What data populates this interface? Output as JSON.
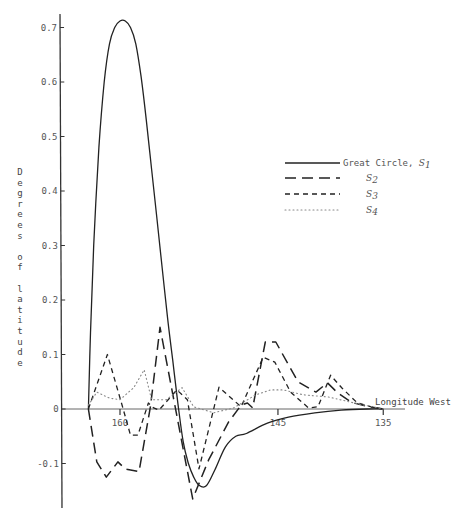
{
  "chart_data": {
    "type": "line",
    "title": "",
    "xlabel": "Longitude West",
    "ylabel": "Degrees of latitude",
    "x_ticks": [
      "160",
      "145",
      "135"
    ],
    "x_tick_values": [
      160,
      145,
      135
    ],
    "y_ticks": [
      "0.7",
      "0.6",
      "0.5",
      "0.4",
      "0.3",
      "0.2",
      "0.1",
      "0",
      "-0.1"
    ],
    "y_tick_values": [
      0.7,
      0.6,
      0.5,
      0.4,
      0.3,
      0.2,
      0.1,
      0,
      -0.1
    ],
    "xlim": [
      163.0,
      133.0
    ],
    "ylim": [
      -0.18,
      0.72
    ],
    "x_reversed": true,
    "grid": false,
    "legend_position": "right-middle",
    "series": [
      {
        "name": "Great Circle, S1",
        "style": "solid",
        "x": [
          163.0,
          162.8,
          162.5,
          162.0,
          161.5,
          161.0,
          160.5,
          160.0,
          159.5,
          159.0,
          158.5,
          158.0,
          157.5,
          157.0,
          156.5,
          156.0,
          155.5,
          155.0,
          154.5,
          154.0,
          153.5,
          153.0,
          152.5,
          151.8,
          151.0,
          150.0,
          149.0,
          148.0,
          146.0,
          144.0,
          141.5,
          139.0,
          136.5,
          135.0
        ],
        "y": [
          0.0,
          0.14,
          0.3,
          0.48,
          0.6,
          0.67,
          0.7,
          0.712,
          0.712,
          0.7,
          0.67,
          0.61,
          0.53,
          0.44,
          0.35,
          0.26,
          0.17,
          0.09,
          0.01,
          -0.06,
          -0.1,
          -0.125,
          -0.14,
          -0.141,
          -0.112,
          -0.07,
          -0.05,
          -0.045,
          -0.026,
          -0.015,
          -0.007,
          -0.002,
          0.0,
          0.0
        ]
      },
      {
        "name": "S2",
        "style": "long-dash",
        "x": [
          163.0,
          162.2,
          161.3,
          160.2,
          159.5,
          158.2,
          157.1,
          156.2,
          153.1,
          151.6,
          149.7,
          148.5,
          147.9,
          147.4,
          146.2,
          145.2,
          143.1,
          141.4,
          140.3,
          139.3,
          138.0,
          136.5,
          135.0
        ],
        "y": [
          0.0,
          -0.097,
          -0.125,
          -0.097,
          -0.11,
          -0.115,
          0.005,
          0.15,
          -0.165,
          -0.094,
          -0.024,
          0.007,
          0.011,
          0.002,
          0.123,
          0.123,
          0.05,
          0.031,
          0.048,
          0.029,
          0.012,
          0.005,
          0.0
        ]
      },
      {
        "name": "S3",
        "style": "short-dash",
        "x": [
          163.0,
          161.2,
          159.8,
          159.0,
          158.3,
          157.3,
          156.8,
          156.3,
          154.6,
          153.6,
          152.5,
          150.6,
          148.5,
          146.4,
          145.3,
          143.8,
          142.1,
          141.2,
          140.0,
          138.9,
          137.5,
          136.0,
          135.0
        ],
        "y": [
          0.0,
          0.1,
          0.007,
          -0.048,
          -0.048,
          0.011,
          0.002,
          -0.002,
          0.035,
          0.017,
          -0.11,
          0.04,
          0.004,
          0.095,
          0.086,
          0.031,
          0.002,
          0.004,
          0.062,
          0.038,
          0.012,
          0.003,
          0.0
        ]
      },
      {
        "name": "S4",
        "style": "dotted",
        "x": [
          163.0,
          162.2,
          161.0,
          160.0,
          158.7,
          157.7,
          157.0,
          155.6,
          154.1,
          153.0,
          151.1,
          149.2,
          147.1,
          145.7,
          144.5,
          142.6,
          140.2,
          137.5,
          135.0
        ],
        "y": [
          0.007,
          0.031,
          0.02,
          0.017,
          0.039,
          0.072,
          0.017,
          0.017,
          0.039,
          0.004,
          -0.007,
          0.002,
          0.026,
          0.035,
          0.035,
          0.026,
          0.022,
          0.01,
          0.0
        ]
      }
    ]
  },
  "legend": {
    "items": [
      {
        "label": "Great Circle, ",
        "sym": "S",
        "sub": "1"
      },
      {
        "label": "",
        "sym": "S",
        "sub": "2"
      },
      {
        "label": "",
        "sym": "S",
        "sub": "3"
      },
      {
        "label": "",
        "sym": "S",
        "sub": "4"
      }
    ]
  },
  "axes": {
    "ylabel_chars": [
      "D",
      "e",
      "g",
      "r",
      "e",
      "e",
      "s",
      "",
      "o",
      "f",
      "",
      "l",
      "a",
      "t",
      "i",
      "t",
      "u",
      "d",
      "e"
    ],
    "x_label": "Longitude West"
  },
  "colors": {
    "line": "#222222",
    "axis": "#333333",
    "text": "#555555"
  }
}
